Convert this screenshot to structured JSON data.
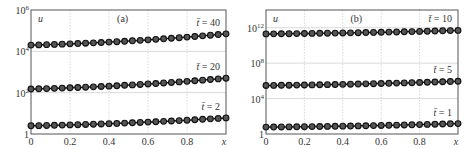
{
  "chart_data": [
    {
      "type": "line",
      "panel_label": "(a)",
      "title": "",
      "xlabel": "x",
      "ylabel": "u",
      "yscale": "log",
      "xlim": [
        0,
        1
      ],
      "ylim": [
        1,
        1000000
      ],
      "x_ticks": [
        "0",
        "0.2",
        "0.4",
        "0.6",
        "0.8"
      ],
      "y_ticks": [
        {
          "label": "1",
          "value": 1
        },
        {
          "label": "10",
          "sup": "2",
          "value": 100
        },
        {
          "label": "10",
          "sup": "4",
          "value": 10000
        },
        {
          "label": "10",
          "sup": "6",
          "value": 1000000
        }
      ],
      "grid": true,
      "marker": "circle",
      "series": [
        {
          "name": "t̄ = 40",
          "t_label": "t̄ = 40",
          "x": [
            0,
            1
          ],
          "values_start": 20000,
          "values_end": 70000
        },
        {
          "name": "t̄ = 20",
          "t_label": "t̄ = 20",
          "x": [
            0,
            1
          ],
          "values_start": 150,
          "values_end": 500
        },
        {
          "name": "t̄ = 2",
          "t_label": "t̄ = 2",
          "x": [
            0,
            1
          ],
          "values_start": 2.5,
          "values_end": 6
        }
      ]
    },
    {
      "type": "line",
      "panel_label": "(b)",
      "title": "",
      "xlabel": "x",
      "ylabel": "u",
      "yscale": "log",
      "xlim": [
        0,
        1
      ],
      "ylim": [
        1,
        100000000000000
      ],
      "x_ticks": [
        "0",
        "0.2",
        "0.4",
        "0.6",
        "0.8"
      ],
      "y_ticks": [
        {
          "label": "1",
          "value": 1
        },
        {
          "label": "10",
          "sup": "4",
          "value": 10000
        },
        {
          "label": "10",
          "sup": "8",
          "value": 100000000
        },
        {
          "label": "10",
          "sup": "12",
          "value": 1000000000000
        }
      ],
      "grid": true,
      "marker": "circle",
      "series": [
        {
          "name": "t̄ = 10",
          "t_label": "t̄ = 10",
          "x": [
            0,
            1
          ],
          "values_start": 200000000000,
          "values_end": 500000000000
        },
        {
          "name": "t̄ = 5",
          "t_label": "t̄ = 5",
          "x": [
            0,
            1
          ],
          "values_start": 300000,
          "values_end": 900000
        },
        {
          "name": "t̄ = 1",
          "t_label": "t̄ = 1",
          "x": [
            0,
            1
          ],
          "values_start": 6,
          "values_end": 15
        }
      ]
    }
  ]
}
